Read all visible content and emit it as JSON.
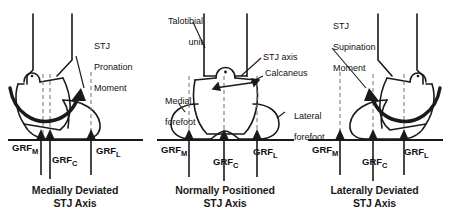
{
  "figure": {
    "background": "#ffffff",
    "ink": "#1a1a1a"
  },
  "panels": [
    {
      "id": "medially-deviated",
      "caption_line1": "Medially Deviated",
      "caption_line2": "STJ Axis",
      "moment_label": {
        "line1": "STJ",
        "line2": "Pronation",
        "line3": "Moment"
      },
      "moment_direction": "pronation",
      "grf": [
        {
          "key": "M",
          "base": "GRF",
          "sub": "M",
          "x": 38
        },
        {
          "key": "C",
          "base": "GRF",
          "sub": "C",
          "x": 62
        },
        {
          "key": "L",
          "base": "GRF",
          "sub": "L",
          "x": 100
        }
      ],
      "axis_lines": [
        43,
        50,
        91
      ]
    },
    {
      "id": "normally-positioned",
      "caption_line1": "Normally Positioned",
      "caption_line2": "STJ Axis",
      "labels": {
        "talotibial_line1": "Talotibial",
        "talotibial_line2": "unit",
        "stj_axis": "STJ axis",
        "calcaneus": "Calcaneus",
        "medial_forefoot_line1": "Medial",
        "medial_forefoot_line2": "forefoot",
        "lateral_forefoot_line1": "Lateral",
        "lateral_forefoot_line2": "forefoot"
      },
      "grf": [
        {
          "key": "M",
          "base": "GRF",
          "sub": "M",
          "x": 36
        },
        {
          "key": "C",
          "base": "GRF",
          "sub": "C",
          "x": 71
        },
        {
          "key": "L",
          "base": "GRF",
          "sub": "L",
          "x": 105
        }
      ],
      "axis_lines": [
        40,
        75,
        108
      ]
    },
    {
      "id": "laterally-deviated",
      "caption_line1": "Laterally Deviated",
      "caption_line2": "STJ Axis",
      "moment_label": {
        "line1": "STJ",
        "line2": "Supination",
        "line3": "Moment"
      },
      "moment_direction": "supination",
      "grf": [
        {
          "key": "M",
          "base": "GRF",
          "sub": "M",
          "x": 34
        },
        {
          "key": "C",
          "base": "GRF",
          "sub": "C",
          "x": 68
        },
        {
          "key": "L",
          "base": "GRF",
          "sub": "L",
          "x": 100
        }
      ],
      "axis_lines": [
        40,
        73,
        104
      ]
    }
  ]
}
